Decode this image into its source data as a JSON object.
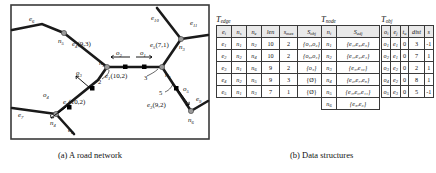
{
  "figure": {
    "caption_a": "(a) A road network",
    "caption_b": "(b) Data structures"
  },
  "road_network": {
    "nodes": [
      {
        "id": "n1",
        "label": "n",
        "sub": "1"
      },
      {
        "id": "n2",
        "label": "n",
        "sub": "2"
      },
      {
        "id": "n3",
        "label": "n",
        "sub": "3"
      },
      {
        "id": "n4",
        "label": "n",
        "sub": "4"
      },
      {
        "id": "n5",
        "label": "n",
        "sub": "5"
      },
      {
        "id": "n6",
        "label": "n",
        "sub": "6"
      }
    ],
    "edges": [
      {
        "id": "e1",
        "label": "e",
        "sub": "1",
        "annotation": "(10,2)"
      },
      {
        "id": "e2",
        "label": "e",
        "sub": "2",
        "annotation": "(10,2)"
      },
      {
        "id": "e3",
        "label": "e",
        "sub": "3",
        "annotation": "(9,2)"
      },
      {
        "id": "e4",
        "label": "e",
        "sub": "4",
        "annotation": "(9,3)"
      },
      {
        "id": "e5",
        "label": "e",
        "sub": "5",
        "annotation": "(7,1)"
      },
      {
        "id": "e6",
        "label": "e",
        "sub": "6",
        "annotation": ""
      },
      {
        "id": "e7",
        "label": "e",
        "sub": "7",
        "annotation": ""
      },
      {
        "id": "e8",
        "label": "e",
        "sub": "8",
        "annotation": ""
      },
      {
        "id": "e9",
        "label": "e",
        "sub": "9",
        "annotation": ""
      },
      {
        "id": "e10",
        "label": "e",
        "sub": "10",
        "annotation": ""
      },
      {
        "id": "e11",
        "label": "e",
        "sub": "11",
        "annotation": ""
      }
    ],
    "objects": [
      {
        "id": "o1",
        "label": "o",
        "sub": "1"
      },
      {
        "id": "o2",
        "label": "o",
        "sub": "2"
      },
      {
        "id": "o3",
        "label": "o",
        "sub": "3"
      },
      {
        "id": "o4",
        "label": "o",
        "sub": "4"
      },
      {
        "id": "o5",
        "label": "o",
        "sub": "5"
      }
    ],
    "distance_marks": [
      "2",
      "3",
      "5"
    ]
  },
  "t_edge": {
    "name": "T",
    "name_sub": "edge",
    "headers": [
      {
        "t": "e",
        "s": "i"
      },
      {
        "t": "n",
        "s": "s"
      },
      {
        "t": "n",
        "s": "e"
      },
      {
        "t": "len",
        "s": ""
      },
      {
        "t": "s",
        "s": "max"
      },
      {
        "t": "S",
        "s": "obj"
      }
    ],
    "rows": [
      {
        "e": {
          "t": "e",
          "s": "1"
        },
        "ns": {
          "t": "n",
          "s": "1"
        },
        "ne": {
          "t": "n",
          "s": "2"
        },
        "len": "10",
        "smax": "2",
        "sobj": "{o₁,o₂}"
      },
      {
        "e": {
          "t": "e",
          "s": "2"
        },
        "ns": {
          "t": "n",
          "s": "2"
        },
        "ne": {
          "t": "n",
          "s": "4"
        },
        "len": "10",
        "smax": "2",
        "sobj": "{o₃,o₄}"
      },
      {
        "e": {
          "t": "e",
          "s": "3"
        },
        "ns": {
          "t": "n",
          "s": "1"
        },
        "ne": {
          "t": "n",
          "s": "6"
        },
        "len": "9",
        "smax": "2",
        "sobj": "{o₅}"
      },
      {
        "e": {
          "t": "e",
          "s": "4"
        },
        "ns": {
          "t": "n",
          "s": "2"
        },
        "ne": {
          "t": "n",
          "s": "5"
        },
        "len": "9",
        "smax": "3",
        "sobj": "{Ø}"
      },
      {
        "e": {
          "t": "e",
          "s": "5"
        },
        "ns": {
          "t": "n",
          "s": "1"
        },
        "ne": {
          "t": "n",
          "s": "3"
        },
        "len": "7",
        "smax": "1",
        "sobj": "{Ø}"
      }
    ]
  },
  "t_node": {
    "name": "T",
    "name_sub": "node",
    "headers": [
      {
        "t": "n",
        "s": "i"
      },
      {
        "t": "S",
        "s": "adj"
      }
    ],
    "rows": [
      {
        "n": {
          "t": "n",
          "s": "1"
        },
        "sadj": "{e₁,e₃,e₅}"
      },
      {
        "n": {
          "t": "n",
          "s": "2"
        },
        "sadj": "{e₁,e₂,e₄}"
      },
      {
        "n": {
          "t": "n",
          "s": "3"
        },
        "sadj": "{e₅,e₁₀}"
      },
      {
        "n": {
          "t": "n",
          "s": "4"
        },
        "sadj": "{e₂,e₇,e₈}"
      },
      {
        "n": {
          "t": "n",
          "s": "5"
        },
        "sadj": "{e₄,e₉,e₁₁}"
      },
      {
        "n": {
          "t": "n",
          "s": "6"
        },
        "sadj": "{e₃,e₆}"
      }
    ]
  },
  "t_obj": {
    "name": "T",
    "name_sub": "obj",
    "headers": [
      {
        "t": "o",
        "s": "i"
      },
      {
        "t": "e",
        "s": "j"
      },
      {
        "t": "t",
        "s": "u"
      },
      {
        "t": "dist",
        "s": ""
      },
      {
        "t": "s",
        "s": ""
      }
    ],
    "rows": [
      {
        "o": {
          "t": "o",
          "s": "1"
        },
        "e": {
          "t": "e",
          "s": "1"
        },
        "tu": "0",
        "dist": "3",
        "s": "-1"
      },
      {
        "o": {
          "t": "o",
          "s": "2"
        },
        "e": {
          "t": "e",
          "s": "1"
        },
        "tu": "0",
        "dist": "7",
        "s": "1"
      },
      {
        "o": {
          "t": "o",
          "s": "3"
        },
        "e": {
          "t": "e",
          "s": "2"
        },
        "tu": "0",
        "dist": "2",
        "s": "1"
      },
      {
        "o": {
          "t": "o",
          "s": "4"
        },
        "e": {
          "t": "e",
          "s": "2"
        },
        "tu": "0",
        "dist": "8",
        "s": "1"
      },
      {
        "o": {
          "t": "o",
          "s": "5"
        },
        "e": {
          "t": "e",
          "s": "3"
        },
        "tu": "0",
        "dist": "5",
        "s": "-1"
      }
    ]
  }
}
